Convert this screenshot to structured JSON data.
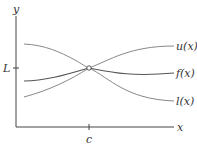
{
  "diagram": {
    "axes": {
      "x_label": "x",
      "y_label": "y",
      "x_tick_label": "c",
      "y_tick_label": "L"
    },
    "curves": [
      {
        "name": "u",
        "label": "u(x)",
        "role": "upper bound"
      },
      {
        "name": "f",
        "label": "f(x)",
        "role": "function"
      },
      {
        "name": "l",
        "label": "l(x)",
        "role": "lower bound"
      }
    ],
    "meeting_point": {
      "x": "c",
      "y": "L",
      "marker": "open-circle"
    },
    "colors": {
      "axes": "#444444",
      "curves": "#777777",
      "f_curve": "#555555",
      "text": "#333333"
    }
  }
}
